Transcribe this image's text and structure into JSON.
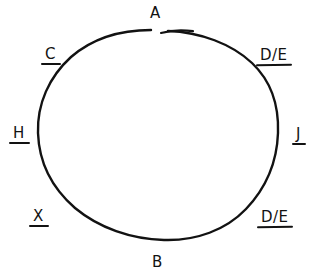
{
  "diagram": {
    "background_color": "#ffffff",
    "ink_color": "#121212",
    "shape": {
      "name": "circle",
      "style": "hand-drawn closed curve with small gap at top",
      "has_gap_at_top": true
    },
    "labels": [
      {
        "id": "a",
        "text": "A",
        "position": "top",
        "underlined": false
      },
      {
        "id": "c",
        "text": "C",
        "position": "upper-left",
        "underlined": true
      },
      {
        "id": "de-top",
        "text": "D/E",
        "position": "upper-right",
        "underlined": true
      },
      {
        "id": "h",
        "text": "H",
        "position": "left",
        "underlined": true
      },
      {
        "id": "j",
        "text": "J",
        "position": "right",
        "underlined": true
      },
      {
        "id": "x",
        "text": "X",
        "position": "lower-left",
        "underlined": true
      },
      {
        "id": "de-bot",
        "text": "D/E",
        "position": "lower-right",
        "underlined": true
      },
      {
        "id": "b",
        "text": "B",
        "position": "bottom",
        "underlined": false
      }
    ]
  }
}
